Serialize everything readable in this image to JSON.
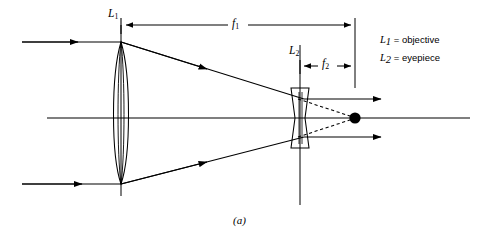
{
  "figure": {
    "caption": "(a)",
    "type": "optical-ray-diagram",
    "background_color": "#ffffff",
    "line_color": "#000000"
  },
  "labels": {
    "lens1": {
      "base": "L",
      "subscript": "1"
    },
    "lens2": {
      "base": "L",
      "subscript": "2"
    },
    "focal1": {
      "base": "f",
      "subscript": "1"
    },
    "focal2": {
      "base": "f",
      "subscript": "2"
    }
  },
  "legend": {
    "rows": [
      {
        "symbol": "L",
        "subscript": "1",
        "equals": "=",
        "text": "objective"
      },
      {
        "symbol": "L",
        "subscript": "2",
        "equals": "=",
        "text": "eyepiece"
      }
    ]
  },
  "geometry": {
    "optical_axis_y": 118,
    "objective_x": 121,
    "eyepiece_x": 300,
    "focal_tick_x": 355,
    "focal_point": {
      "x": 355,
      "y": 118
    },
    "incoming_ray_top_y": 42,
    "incoming_ray_bottom_y": 184,
    "incoming_ray_start_x": 22,
    "axis_start_x": 47,
    "axis_end_x": 470,
    "exit_ray_top_y": 99,
    "exit_ray_bottom_y": 137,
    "exit_ray_end_x": 381,
    "f1_arrow_y": 25,
    "f2_arrow_y": 66
  }
}
